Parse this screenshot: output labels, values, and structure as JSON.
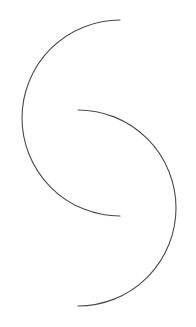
{
  "figure": {
    "arcs": [
      {
        "name": "upper-arc",
        "opening": "right"
      },
      {
        "name": "lower-arc",
        "opening": "left"
      }
    ],
    "colors": {
      "background": "#ffffff",
      "stroke": "#4a4a4a"
    }
  }
}
